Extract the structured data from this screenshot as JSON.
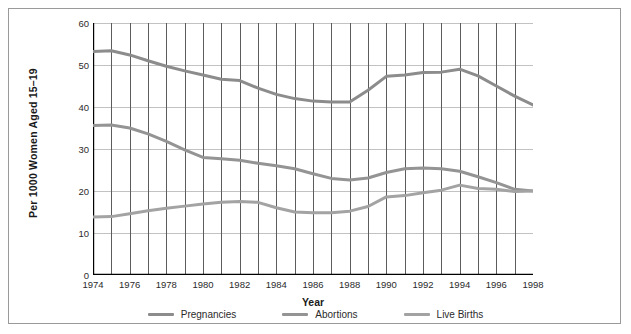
{
  "chart_data": {
    "type": "line",
    "title": "",
    "xlabel": "Year",
    "ylabel": "Per 1000 Women Aged 15–19",
    "xlim": [
      1974,
      1998
    ],
    "ylim": [
      0,
      60
    ],
    "ytick_step": 10,
    "xtick_step": 2,
    "grid": true,
    "legend_position": "bottom",
    "x": [
      1974,
      1975,
      1976,
      1977,
      1978,
      1979,
      1980,
      1981,
      1982,
      1983,
      1984,
      1985,
      1986,
      1987,
      1988,
      1989,
      1990,
      1991,
      1992,
      1993,
      1994,
      1995,
      1996,
      1997,
      1998
    ],
    "xtick_labels": [
      "1974",
      "1976",
      "1978",
      "1980",
      "1982",
      "1984",
      "1986",
      "1988",
      "1990",
      "1992",
      "1994",
      "1996",
      "1998"
    ],
    "ytick_labels": [
      "0",
      "10",
      "20",
      "30",
      "40",
      "50",
      "60"
    ],
    "series": [
      {
        "name": "Pregnancies",
        "color": "#8c8c8c",
        "values": [
          53.2,
          53.4,
          52.4,
          51.0,
          49.7,
          48.6,
          47.6,
          46.6,
          46.3,
          44.5,
          43.0,
          42.0,
          41.4,
          41.2,
          41.2,
          44.0,
          47.3,
          47.6,
          48.2,
          48.3,
          49.0,
          47.4,
          45.0,
          42.6,
          40.5
        ]
      },
      {
        "name": "Abortions",
        "color": "#949494",
        "values": [
          35.6,
          35.7,
          35.0,
          33.6,
          31.8,
          29.8,
          28.0,
          27.7,
          27.3,
          26.6,
          26.0,
          25.3,
          24.1,
          23.0,
          22.6,
          23.1,
          24.4,
          25.3,
          25.5,
          25.3,
          24.7,
          23.4,
          22.0,
          20.4,
          20.0
        ]
      },
      {
        "name": "Live Births",
        "color": "#a3a3a3",
        "values": [
          13.8,
          13.9,
          14.6,
          15.3,
          15.9,
          16.4,
          16.9,
          17.3,
          17.5,
          17.3,
          16.0,
          15.0,
          14.8,
          14.8,
          15.2,
          16.3,
          18.6,
          18.9,
          19.6,
          20.2,
          21.4,
          20.6,
          20.4,
          19.9,
          20.0
        ]
      }
    ]
  },
  "legend": {
    "items": [
      {
        "label": "Pregnancies"
      },
      {
        "label": "Abortions"
      },
      {
        "label": "Live Births"
      }
    ]
  }
}
